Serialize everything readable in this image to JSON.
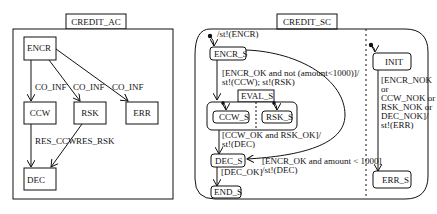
{
  "left_diagram": {
    "title": "CREDIT_AC",
    "states": {
      "encr": "ENCR",
      "ccw": "CCW",
      "rsk": "RSK",
      "err": "ERR",
      "dec": "DEC"
    },
    "transitions": {
      "encr_ccw": "CO_INF",
      "encr_rsk": "CO_INF",
      "encr_err": "CO_INF",
      "ccw_dec": "RES_CCW",
      "rsk_dec": "RES_RSK"
    }
  },
  "right_diagram": {
    "title": "CREDIT_SC",
    "states": {
      "encr_s": "ENCR_S",
      "eval_s": "EVAL_S",
      "ccw_s": "CCW_S",
      "rsk_s": "RSK_S",
      "dec_s": "DEC_S",
      "end_s": "END_S",
      "init": "INIT",
      "err_s": "ERR_S"
    },
    "transitions": {
      "initial_encr": "/st!(ENCR)",
      "encr_eval_line1": "[ENCR_OK and not (amount<1000)]/",
      "encr_eval_line2": "st!(CCW); st!(RSK)",
      "eval_dec_line1": "[CCW_OK and RSK_OK]/",
      "eval_dec_line2": "st!(DEC)",
      "encr_dec_line1": "[ENCR_OK and amount < 1000]",
      "encr_dec_line2": "/st!(DEC)",
      "dec_end": "[DEC_OK]",
      "init_err_line1": "[ENCR_NOK",
      "init_err_line2": "or",
      "init_err_line3": "CCW_NOK or",
      "init_err_line4": "RSK_NOK or",
      "init_err_line5": "DEC_NOK]/",
      "init_err_line6": "st!(ERR)"
    }
  }
}
